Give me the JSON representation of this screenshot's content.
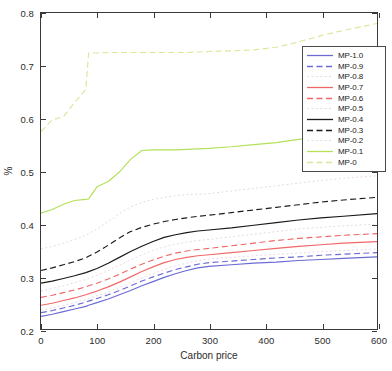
{
  "chart_data": {
    "type": "line",
    "title": "",
    "xlabel": "Carbon price",
    "ylabel": "%",
    "xlim": [
      0,
      600
    ],
    "ylim": [
      0.2,
      0.8
    ],
    "xticks": [
      0,
      100,
      200,
      300,
      400,
      500,
      600
    ],
    "yticks": [
      0.2,
      0.3,
      0.4,
      0.5,
      0.6,
      0.7,
      0.8
    ],
    "xticklabels": [
      "0",
      "100",
      "200",
      "300",
      "400",
      "500",
      "600"
    ],
    "yticklabels": [
      "0.2",
      "0.3",
      "0.4",
      "0.5",
      "0.6",
      "0.7",
      "0.8"
    ],
    "grid": false,
    "legend_position": "upper right",
    "x": [
      0,
      20,
      40,
      60,
      80,
      85,
      100,
      120,
      140,
      160,
      180,
      200,
      220,
      240,
      260,
      280,
      300,
      340,
      380,
      420,
      460,
      500,
      540,
      600
    ],
    "series": [
      {
        "name": "MP-1.0",
        "color": "#6b6bd6",
        "style": "solid",
        "values": [
          0.224,
          0.228,
          0.233,
          0.238,
          0.243,
          0.245,
          0.25,
          0.257,
          0.265,
          0.273,
          0.282,
          0.29,
          0.298,
          0.305,
          0.311,
          0.316,
          0.319,
          0.322,
          0.325,
          0.327,
          0.33,
          0.332,
          0.334,
          0.337
        ]
      },
      {
        "name": "MP-0.9",
        "color": "#6b6bd6",
        "style": "dashed",
        "values": [
          0.231,
          0.235,
          0.24,
          0.245,
          0.251,
          0.253,
          0.258,
          0.265,
          0.273,
          0.282,
          0.291,
          0.299,
          0.306,
          0.313,
          0.318,
          0.323,
          0.326,
          0.329,
          0.332,
          0.335,
          0.337,
          0.34,
          0.342,
          0.345
        ]
      },
      {
        "name": "MP-0.8",
        "color": "#e8d8e8",
        "style": "dotted",
        "values": [
          0.236,
          0.24,
          0.245,
          0.25,
          0.256,
          0.258,
          0.263,
          0.27,
          0.279,
          0.288,
          0.297,
          0.305,
          0.313,
          0.32,
          0.325,
          0.33,
          0.333,
          0.336,
          0.339,
          0.342,
          0.344,
          0.347,
          0.349,
          0.352
        ]
      },
      {
        "name": "MP-0.7",
        "color": "#f06868",
        "style": "solid",
        "values": [
          0.245,
          0.249,
          0.254,
          0.259,
          0.265,
          0.267,
          0.272,
          0.28,
          0.289,
          0.299,
          0.309,
          0.318,
          0.326,
          0.332,
          0.336,
          0.339,
          0.341,
          0.345,
          0.349,
          0.353,
          0.357,
          0.36,
          0.363,
          0.366
        ]
      },
      {
        "name": "MP-0.6",
        "color": "#f06868",
        "style": "dashed",
        "values": [
          0.26,
          0.264,
          0.269,
          0.274,
          0.28,
          0.282,
          0.287,
          0.295,
          0.304,
          0.314,
          0.323,
          0.331,
          0.338,
          0.344,
          0.348,
          0.351,
          0.353,
          0.358,
          0.363,
          0.368,
          0.372,
          0.375,
          0.378,
          0.381
        ]
      },
      {
        "name": "MP-0.5",
        "color": "#e8d8e8",
        "style": "dotted",
        "values": [
          0.272,
          0.277,
          0.282,
          0.288,
          0.294,
          0.296,
          0.302,
          0.311,
          0.321,
          0.331,
          0.341,
          0.349,
          0.356,
          0.361,
          0.365,
          0.368,
          0.37,
          0.375,
          0.38,
          0.385,
          0.39,
          0.393,
          0.396,
          0.399
        ]
      },
      {
        "name": "MP-0.4",
        "color": "#1a1a1a",
        "style": "solid",
        "values": [
          0.287,
          0.291,
          0.296,
          0.301,
          0.307,
          0.309,
          0.315,
          0.325,
          0.336,
          0.347,
          0.357,
          0.366,
          0.374,
          0.379,
          0.383,
          0.386,
          0.388,
          0.392,
          0.397,
          0.402,
          0.407,
          0.411,
          0.414,
          0.419
        ]
      },
      {
        "name": "MP-0.3",
        "color": "#1a1a1a",
        "style": "dashed",
        "values": [
          0.311,
          0.316,
          0.322,
          0.328,
          0.335,
          0.338,
          0.346,
          0.359,
          0.373,
          0.385,
          0.393,
          0.399,
          0.404,
          0.408,
          0.411,
          0.414,
          0.416,
          0.421,
          0.426,
          0.431,
          0.436,
          0.441,
          0.445,
          0.45
        ]
      },
      {
        "name": "MP-0.2",
        "color": "#e8d8e8",
        "style": "dotted",
        "values": [
          0.352,
          0.357,
          0.363,
          0.37,
          0.378,
          0.381,
          0.39,
          0.404,
          0.419,
          0.432,
          0.44,
          0.446,
          0.45,
          0.453,
          0.455,
          0.456,
          0.457,
          0.462,
          0.467,
          0.472,
          0.477,
          0.482,
          0.486,
          0.491
        ]
      },
      {
        "name": "MP-0.1",
        "color": "#b4e05a",
        "style": "solid",
        "values": [
          0.42,
          0.427,
          0.437,
          0.444,
          0.446,
          0.447,
          0.47,
          0.48,
          0.498,
          0.522,
          0.539,
          0.54,
          0.54,
          0.54,
          0.541,
          0.542,
          0.543,
          0.546,
          0.55,
          0.554,
          0.56,
          0.566,
          0.573,
          0.588
        ]
      },
      {
        "name": "MP-0",
        "color": "#d8e89a",
        "style": "dashed",
        "values": [
          0.575,
          0.597,
          0.603,
          0.63,
          0.655,
          0.724,
          0.724,
          0.725,
          0.725,
          0.725,
          0.725,
          0.725,
          0.725,
          0.725,
          0.725,
          0.726,
          0.727,
          0.728,
          0.73,
          0.735,
          0.745,
          0.757,
          0.767,
          0.78
        ]
      }
    ]
  },
  "legend": {
    "entries": [
      {
        "label": "MP-1.0"
      },
      {
        "label": "MP-0.9"
      },
      {
        "label": "MP-0.8"
      },
      {
        "label": "MP-0.7"
      },
      {
        "label": "MP-0.6"
      },
      {
        "label": "MP-0.5"
      },
      {
        "label": "MP-0.4"
      },
      {
        "label": "MP-0.3"
      },
      {
        "label": "MP-0.2"
      },
      {
        "label": "MP-0.1"
      },
      {
        "label": "MP-0"
      }
    ]
  }
}
